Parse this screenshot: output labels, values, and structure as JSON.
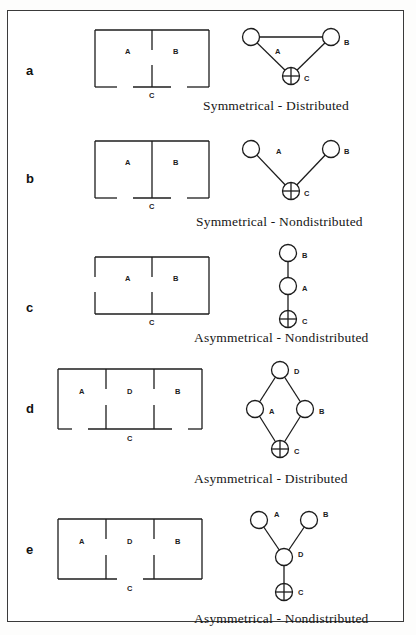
{
  "figure": {
    "border_color": "#3a3a3a",
    "background": "#ffffff",
    "rows": [
      {
        "letter": "a",
        "caption": "Symmetrical - Distributed",
        "plan_labels": {
          "room_left": "A",
          "room_mid": "",
          "room_right": "B",
          "outside": "C"
        },
        "graph_labels": {
          "n1": "A",
          "n2": "B",
          "n3": "C"
        }
      },
      {
        "letter": "b",
        "caption": "Symmetrical - Nondistributed",
        "plan_labels": {
          "room_left": "A",
          "room_mid": "",
          "room_right": "B",
          "outside": "C"
        },
        "graph_labels": {
          "n1": "A",
          "n2": "B",
          "n3": "C"
        }
      },
      {
        "letter": "c",
        "caption": "Asymmetrical - Nondistributed",
        "plan_labels": {
          "room_left": "A",
          "room_mid": "",
          "room_right": "B",
          "outside": "C"
        },
        "graph_labels": {
          "n1": "B",
          "n2": "A",
          "n3": "C"
        }
      },
      {
        "letter": "d",
        "caption": "Asymmetrical - Distributed",
        "plan_labels": {
          "room_left": "A",
          "room_mid": "D",
          "room_right": "B",
          "outside": "C"
        },
        "graph_labels": {
          "n1": "D",
          "n2": "A",
          "n3": "B",
          "n4": "C"
        }
      },
      {
        "letter": "e",
        "caption": "Asymmetrical - Nondistributed",
        "plan_labels": {
          "room_left": "A",
          "room_mid": "D",
          "room_right": "B",
          "outside": "C"
        },
        "graph_labels": {
          "n1": "A",
          "n2": "B",
          "n3": "D",
          "n4": "C"
        }
      }
    ]
  }
}
